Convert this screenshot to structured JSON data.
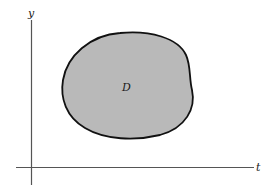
{
  "diagram": {
    "type": "region-in-plane",
    "axes": {
      "horizontal_label": "t",
      "vertical_label": "y",
      "color": "#555555"
    },
    "region": {
      "label": "D",
      "fill": "#b9b9b9",
      "stroke": "#111111"
    }
  }
}
